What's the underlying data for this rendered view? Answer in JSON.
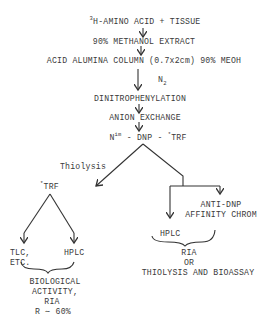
{
  "diagram": {
    "type": "flowchart",
    "steps": {
      "start_sup": "3",
      "start": "H-AMINO ACID + TISSUE",
      "extract": "90% METHANOL EXTRACT",
      "column": "ACID ALUMINA COLUMN (0.7x2cm) 90% MEOH",
      "gas": "N",
      "gas_sub": "2",
      "dnp": "DINITROPHENYLATION",
      "anion": "ANION EXCHANGE",
      "product_n": "N",
      "product_sup": "im",
      "product_rest": " - DNP - ",
      "product_star": "*",
      "product_trf": "TRF"
    },
    "left_branch": {
      "edge_label": "Thiolysis",
      "node_star": "*",
      "node": "TRF",
      "child_left_1": "TLC,",
      "child_left_2": "ETC.",
      "child_right": "HPLC",
      "result_lines": [
        "BIOLOGICAL",
        "ACTIVITY,",
        "RIA",
        "R ∼ 60%"
      ]
    },
    "right_branch": {
      "side_1": "ANTI-DNP",
      "side_2": "AFFINITY CHROM",
      "child": "HPLC",
      "result_lines": [
        "RIA",
        "OR",
        "THIOLYSIS AND BIOASSAY"
      ]
    },
    "colors": {
      "ink": "#3a3a3a",
      "background": "#ffffff"
    }
  }
}
